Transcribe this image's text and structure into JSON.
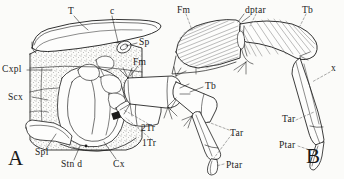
{
  "figure": {
    "type": "scientific-line-drawing",
    "background_color": "#fbfbf9",
    "ink_color": "#1a1a1a",
    "panels": [
      {
        "id": "A",
        "label": "A",
        "description": "Lateral view of thoracic segment with coxa and leg base, cut-away showing internal structures, stippled cuticle"
      },
      {
        "id": "B",
        "label": "B",
        "description": "Leg segments femur through pretarsus with hatched muscle fibers"
      }
    ],
    "labels": [
      {
        "id": "T",
        "text": "T",
        "x": 68,
        "y": 7,
        "panel": "A",
        "meaning": "tergum"
      },
      {
        "id": "c",
        "text": "c",
        "x": 110,
        "y": 7,
        "panel": "A",
        "meaning": "crista"
      },
      {
        "id": "Sp",
        "text": "Sp",
        "x": 139,
        "y": 38,
        "panel": "A",
        "meaning": "spiracle"
      },
      {
        "id": "Cxpl",
        "text": "Cxpl",
        "x": 2,
        "y": 68,
        "panel": "A",
        "meaning": "coxopleurite"
      },
      {
        "id": "Scx",
        "text": "Scx",
        "x": 8,
        "y": 96,
        "panel": "A",
        "meaning": "subcoxa"
      },
      {
        "id": "Spl",
        "text": "Spl",
        "x": 35,
        "y": 150,
        "panel": "A",
        "meaning": "sternopleurite"
      },
      {
        "id": "Stn_d",
        "text": "Stn d",
        "x": 61,
        "y": 162,
        "panel": "A",
        "meaning": "sternum, dorsal"
      },
      {
        "id": "Cx",
        "text": "Cx",
        "x": 113,
        "y": 162,
        "panel": "A",
        "meaning": "coxa"
      },
      {
        "id": "Fm_A",
        "text": "Fm",
        "x": 133,
        "y": 61,
        "panel": "A",
        "meaning": "femur"
      },
      {
        "id": "1Tr",
        "text": "1Tr",
        "x": 142,
        "y": 141,
        "panel": "A",
        "meaning": "first trochanter"
      },
      {
        "id": "2Tr",
        "text": "2Tr",
        "x": 141,
        "y": 126,
        "panel": "A",
        "meaning": "second trochanter"
      },
      {
        "id": "Tb_A",
        "text": "Tb",
        "x": 205,
        "y": 84,
        "panel": "A",
        "meaning": "tibia"
      },
      {
        "id": "Tar_A",
        "text": "Tar",
        "x": 230,
        "y": 131,
        "panel": "A",
        "meaning": "tarsus"
      },
      {
        "id": "Ptar_A",
        "text": "Ptar",
        "x": 227,
        "y": 163,
        "panel": "A",
        "meaning": "pretarsus"
      },
      {
        "id": "Fm_B",
        "text": "Fm",
        "x": 177,
        "y": 8,
        "panel": "B",
        "meaning": "femur"
      },
      {
        "id": "dptar",
        "text": "dptar",
        "x": 248,
        "y": 8,
        "panel": "B",
        "meaning": "depressor of pretarsus"
      },
      {
        "id": "Tb_B",
        "text": "Tb",
        "x": 302,
        "y": 8,
        "panel": "B",
        "meaning": "tibia"
      },
      {
        "id": "x",
        "text": "x",
        "x": 331,
        "y": 67,
        "panel": "B",
        "meaning": "unlabelled point x"
      },
      {
        "id": "Tar_B",
        "text": "Tar",
        "x": 283,
        "y": 117,
        "panel": "B",
        "meaning": "tarsus"
      },
      {
        "id": "Ptar_B",
        "text": "Ptar",
        "x": 280,
        "y": 143,
        "panel": "B",
        "meaning": "pretarsus"
      }
    ],
    "panel_labels": [
      {
        "id": "A",
        "text": "A",
        "x": 8,
        "y": 150
      },
      {
        "id": "B",
        "text": "B",
        "x": 306,
        "y": 148
      }
    ]
  }
}
